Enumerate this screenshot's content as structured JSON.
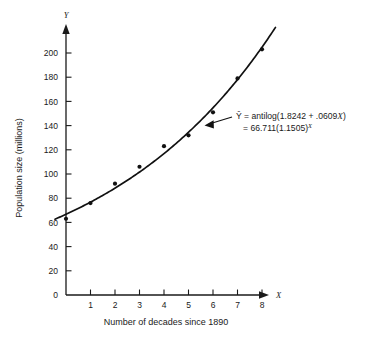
{
  "chart_data": {
    "type": "scatter",
    "title": "",
    "xlabel": "Number of decades since 1890",
    "ylabel": "Population size (millions)",
    "x_axis_letter": "X",
    "y_axis_letter": "Y",
    "x": [
      0,
      1,
      2,
      3,
      4,
      5,
      6,
      7,
      8
    ],
    "values": [
      63,
      76,
      92,
      106,
      123,
      132,
      151,
      179,
      203
    ],
    "xticks": [
      1,
      2,
      3,
      4,
      5,
      6,
      7,
      8
    ],
    "yticks": [
      0,
      20,
      40,
      60,
      80,
      100,
      120,
      140,
      160,
      180,
      200
    ],
    "xlim": [
      -0.45,
      8.9
    ],
    "ylim": [
      0,
      215
    ],
    "grid": false,
    "legend": "none",
    "fit_curve": {
      "form": "exponential",
      "intercept_log10": 1.8242,
      "slope_log10": 0.0609,
      "a": 66.711,
      "b": 1.1505,
      "x_range": [
        -0.45,
        8.55
      ]
    },
    "annotation": {
      "line1_prefix": "Ŷ = antilog(1.8242 + .0609",
      "line1_var": "X",
      "line1_suffix": ")",
      "line2_prefix": "= 66.711(1.1505)",
      "line2_sup": "X",
      "arrow": "arrow-pointing-to-curve"
    },
    "series_name": "U.S. population by decade",
    "marker": "filled-circle",
    "marker_color": "#111111",
    "curve_color": "#111111",
    "axis_color": "#1a1a1a",
    "background_color": "#ffffff"
  }
}
